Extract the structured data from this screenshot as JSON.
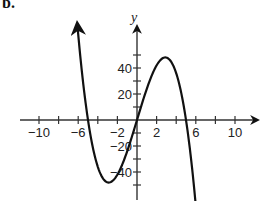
{
  "part_label": "b.",
  "chart_data": {
    "type": "line",
    "title": "",
    "xlabel": "",
    "ylabel": "y",
    "xlim": [
      -12,
      12
    ],
    "ylim": [
      -60,
      60
    ],
    "grid": false,
    "x_tick_labels": [
      "−10",
      "−6",
      "−2",
      "2",
      "6",
      "10"
    ],
    "x_tick_values": [
      -10,
      -6,
      -2,
      2,
      6,
      10
    ],
    "x_minor_ticks_every": 2,
    "y_tick_labels": [
      "40",
      "20",
      "−20",
      "−40"
    ],
    "y_tick_values": [
      40,
      20,
      -20,
      -40
    ],
    "y_minor_ticks_every": 10,
    "series": [
      {
        "name": "f(x)",
        "description": "cubic curve with arrows on both ends; x-intercepts near -5, 0, 5; local min about (-3, -48); local max about (3, 48)",
        "x": [
          -6.1,
          -5,
          -4,
          -3,
          -2,
          -1,
          0,
          1,
          2,
          3,
          4,
          5,
          6.4
        ],
        "y": [
          65,
          0,
          -36,
          -48,
          -42,
          -24,
          0,
          24,
          42,
          48,
          36,
          0,
          -102
        ]
      }
    ],
    "key_points": {
      "x_intercepts": [
        -5,
        0,
        5
      ],
      "local_max": [
        3,
        48
      ],
      "local_min": [
        -3,
        -48
      ]
    }
  }
}
